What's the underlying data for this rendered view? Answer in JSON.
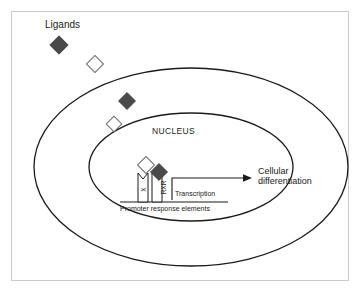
{
  "figure": {
    "labels": {
      "ligands": "Ligands",
      "nucleus": "NUCLEUS",
      "transcription": "Transcription",
      "cellular_line1": "Cellular",
      "cellular_line2": "differentiation",
      "promoter": "Promoter response elements",
      "receptor_left": "X",
      "receptor_right": "RXR"
    },
    "colors": {
      "filled_diamond": "#4a4a4a",
      "open_diamond_stroke": "#6b6b6b",
      "stroke": "#1a1a1a",
      "frame": "#c9c9c9",
      "background": "#ffffff",
      "text": "#1a1a1a"
    },
    "shapes": {
      "cell_membrane": {
        "cx": 191,
        "cy": 167,
        "rx": 157,
        "ry": 99
      },
      "nuclear_envelope": {
        "cx": 191,
        "cy": 167,
        "rx": 102,
        "ry": 54
      }
    },
    "ligands": [
      {
        "type": "filled",
        "cx": 59,
        "cy": 45,
        "size": 13
      },
      {
        "type": "open",
        "cx": 95,
        "cy": 64,
        "size": 12
      },
      {
        "type": "filled",
        "cx": 127,
        "cy": 101,
        "size": 12
      },
      {
        "type": "open",
        "cx": 114,
        "cy": 124,
        "size": 11
      },
      {
        "type": "open",
        "cx": 146,
        "cy": 165,
        "size": 12
      },
      {
        "type": "filled",
        "cx": 159,
        "cy": 172,
        "size": 12
      }
    ]
  }
}
